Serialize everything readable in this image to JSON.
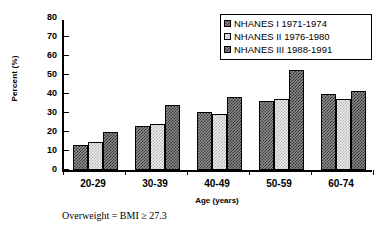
{
  "chart_data": {
    "type": "bar",
    "title": "",
    "categories": [
      "20-29",
      "30-39",
      "40-49",
      "50-59",
      "60-74"
    ],
    "series": [
      {
        "name": "NHANES I 1971-1974",
        "values": [
          13.0,
          23.0,
          30.5,
          36.5,
          40.0
        ],
        "swatch": "dark-checker"
      },
      {
        "name": "NHANES II 1976-1980",
        "values": [
          15.0,
          24.0,
          29.5,
          37.5,
          37.5
        ],
        "swatch": "light-checker"
      },
      {
        "name": "NHANES III 1988-1991",
        "values": [
          20.0,
          34.0,
          38.5,
          52.5,
          41.5
        ],
        "swatch": "dark-checker"
      }
    ],
    "xlabel": "Age (years)",
    "ylabel": "Percent (%)",
    "ylim": [
      0,
      80
    ],
    "yticks": [
      0,
      10,
      20,
      30,
      40,
      50,
      60,
      70,
      80
    ],
    "ytick_labels": [
      "0",
      "10",
      "20",
      "30",
      "40",
      "50",
      "60",
      "70",
      "80"
    ],
    "grid": false,
    "legend_position": "top-right",
    "annotations": [
      "Overweight = BMI ≥ 27.3"
    ]
  },
  "legend": {
    "items": [
      {
        "label": "NHANES I 1971-1974"
      },
      {
        "label": "NHANES II 1976-1980"
      },
      {
        "label": "NHANES III 1988-1991"
      }
    ]
  },
  "footnote": "Overweight = BMI ≥ 27.3"
}
